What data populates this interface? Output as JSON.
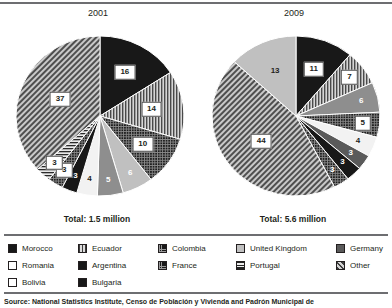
{
  "source_note": "Source: National Statistics Institute, Censo de Población y Vivienda and Padrón Municipal de",
  "charts": [
    {
      "title": "2001",
      "total_label": "Total: 1.5 million",
      "slices": [
        {
          "label": "16",
          "value": 16,
          "category": "Morocco",
          "pattern": "solid-black",
          "label_style": "boxed"
        },
        {
          "label": "14",
          "value": 14,
          "category": "Ecuador",
          "pattern": "vertical-lines",
          "label_style": "boxed"
        },
        {
          "label": "10",
          "value": 10,
          "category": "Colombia",
          "pattern": "dark-grid",
          "label_style": "boxed"
        },
        {
          "label": "6",
          "value": 6,
          "category": "United Kingdom",
          "pattern": "light-gray",
          "label_style": "plain-light"
        },
        {
          "label": "5",
          "value": 5,
          "category": "Germany",
          "pattern": "mid-gray",
          "label_style": "plain-light"
        },
        {
          "label": "4",
          "value": 4,
          "category": "Romania",
          "pattern": "near-white",
          "label_style": "plain-dark"
        },
        {
          "label": "3",
          "value": 3,
          "category": "Argentina",
          "pattern": "solid-black",
          "label_style": "plain-light"
        },
        {
          "label": "3",
          "value": 3,
          "category": "France",
          "pattern": "dark-grid",
          "label_style": "boxed"
        },
        {
          "label": "3",
          "value": 3,
          "category": "Portugal",
          "pattern": "horiz-lines",
          "label_style": "boxed"
        },
        {
          "label": "37",
          "value": 37,
          "category": "Other",
          "pattern": "diagonal-hatch",
          "label_style": "boxed"
        }
      ]
    },
    {
      "title": "2009",
      "total_label": "Total: 5.6 million",
      "slices": [
        {
          "label": "11",
          "value": 11,
          "category": "Morocco",
          "pattern": "solid-black",
          "label_style": "boxed"
        },
        {
          "label": "7",
          "value": 7,
          "category": "Ecuador",
          "pattern": "vertical-lines",
          "label_style": "boxed"
        },
        {
          "label": "6",
          "value": 6,
          "category": "Colombia",
          "pattern": "mid-gray",
          "label_style": "plain-light"
        },
        {
          "label": "5",
          "value": 5,
          "category": "United Kingdom",
          "pattern": "dark-grid",
          "label_style": "boxed"
        },
        {
          "label": "4",
          "value": 4,
          "category": "Romania",
          "pattern": "near-white",
          "label_style": "plain-dark"
        },
        {
          "label": "3",
          "value": 3,
          "category": "Germany",
          "pattern": "dark-gray",
          "label_style": "plain-light"
        },
        {
          "label": "3",
          "value": 3,
          "category": "Argentina",
          "pattern": "solid-black",
          "label_style": "plain-light"
        },
        {
          "label": "3",
          "value": 3,
          "category": "France",
          "pattern": "dark-grid",
          "label_style": "plain-light"
        },
        {
          "label": "44",
          "value": 44,
          "category": "Other",
          "pattern": "diagonal-hatch",
          "label_style": "boxed"
        },
        {
          "label": "13",
          "value": 13,
          "category": "Bolivia",
          "pattern": "light-gray",
          "label_style": "plain-dark"
        }
      ]
    }
  ],
  "legend": {
    "rows": [
      [
        {
          "label": "Morocco",
          "pattern": "solid-black"
        },
        {
          "label": "Ecuador",
          "pattern": "vertical-lines"
        },
        {
          "label": "Colombia",
          "pattern": "dark-grid"
        },
        {
          "label": "United Kingdom",
          "pattern": "light-gray"
        },
        {
          "label": "Germany",
          "pattern": "dark-gray"
        }
      ],
      [
        {
          "label": "Romania",
          "pattern": "near-white"
        },
        {
          "label": "Argentina",
          "pattern": "solid-black"
        },
        {
          "label": "France",
          "pattern": "dark-grid"
        },
        {
          "label": "Portugal",
          "pattern": "horiz-lines"
        },
        {
          "label": "Other",
          "pattern": "diagonal-hatch"
        }
      ],
      [
        {
          "label": "Bolivia",
          "pattern": "near-white"
        },
        {
          "label": "Bulgaria",
          "pattern": "solid-black"
        }
      ]
    ]
  },
  "chart_data": {
    "type": "pie",
    "unit": "percent",
    "legend_position": "bottom",
    "charts": [
      {
        "title": "2001",
        "total": "1.5 million",
        "labels": [
          "Morocco",
          "Ecuador",
          "Colombia",
          "United Kingdom",
          "Germany",
          "Romania",
          "Argentina",
          "France",
          "Portugal",
          "Other"
        ],
        "values": [
          16,
          14,
          10,
          6,
          5,
          4,
          3,
          3,
          3,
          37
        ]
      },
      {
        "title": "2009",
        "total": "5.6 million",
        "labels": [
          "Morocco",
          "Ecuador",
          "Colombia",
          "United Kingdom",
          "Romania",
          "Germany",
          "Argentina",
          "France",
          "Other",
          "Bolivia"
        ],
        "values": [
          11,
          7,
          6,
          5,
          4,
          3,
          3,
          3,
          44,
          13
        ]
      }
    ]
  }
}
